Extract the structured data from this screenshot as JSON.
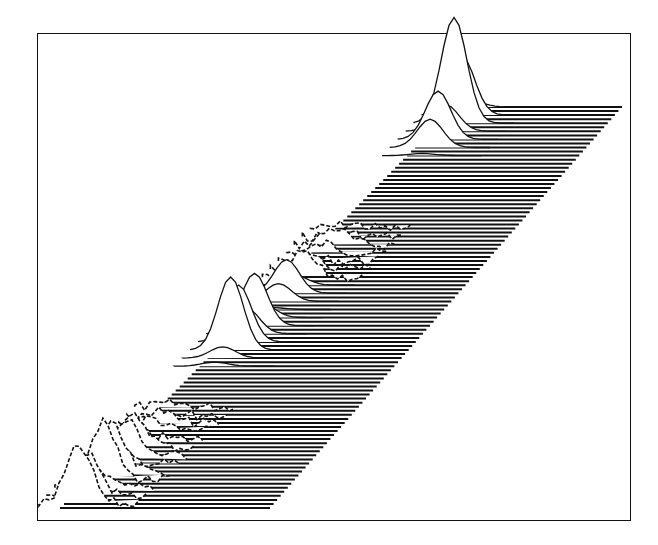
{
  "figure": {
    "ink_color": "#111111",
    "paper_color": "#ffffff",
    "caption_visible": false
  },
  "chart_data": {
    "type": "area",
    "title": "",
    "xlabel": "",
    "ylabel": "",
    "zlabel": "",
    "axes_visible": false,
    "grid": false,
    "legend": null,
    "projection": "oblique 3D stacked traces (waterfall / surface)",
    "band": {
      "trace_count": 100,
      "top_edge_px": [
        [
          455,
          107
        ],
        [
          622,
          107
        ]
      ],
      "bottom_edge_px": [
        [
          60,
          508
        ],
        [
          270,
          508
        ]
      ]
    },
    "ridge_peaks": [
      {
        "name": "broad noisy cluster",
        "x_rel": 0.05,
        "height_rel": 0.45,
        "width_rel": 0.18,
        "noisy": true
      },
      {
        "name": "peak 2",
        "x_rel": 0.42,
        "height_rel": 0.72,
        "width_rel": 0.06,
        "noisy": false
      },
      {
        "name": "peak 3",
        "x_rel": 0.55,
        "height_rel": 0.35,
        "width_rel": 0.05,
        "noisy": false
      },
      {
        "name": "minor bump",
        "x_rel": 0.66,
        "height_rel": 0.12,
        "width_rel": 0.06,
        "noisy": true
      },
      {
        "name": "peak 5",
        "x_rel": 0.95,
        "height_rel": 0.85,
        "width_rel": 0.06,
        "noisy": false
      }
    ]
  }
}
